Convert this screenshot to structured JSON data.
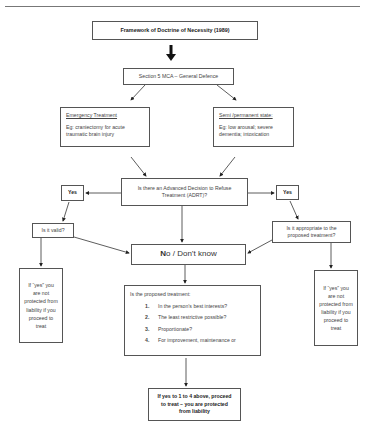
{
  "title_box": {
    "text": "Framework of Doctrine of Necessity (1989)"
  },
  "section5_box": {
    "text": "Section 5 MCA – General Defence"
  },
  "emergency_box": {
    "heading": "Emergency Treatment",
    "example": "Eg: craniectomy for acute traumatic brain injury"
  },
  "semi_permanent_box": {
    "heading": "Semi /permanent state:",
    "example": "Eg: low arousal; severe dementia; intoxication"
  },
  "adrt_box": {
    "text": "Is there an Advanced Decision to Refuse Treatment (ADRT)?"
  },
  "yes_left": {
    "text": "Yes"
  },
  "yes_right": {
    "text": "Yes"
  },
  "valid_box": {
    "text": "Is it valid?"
  },
  "appropriate_box": {
    "text": "Is it appropriate to the proposed treatment?"
  },
  "no_box": {
    "first_letter": "N",
    "rest": "o / Don’t know"
  },
  "liability_left": {
    "text": "If “yes” you are not protected from liability if you proceed to treat"
  },
  "liability_right": {
    "text": "If “yes” you are not protected from liability if you proceed to treat"
  },
  "proposed_box": {
    "heading": "Is the proposed treatment:",
    "items": [
      {
        "num": "1.",
        "text": "In the person’s best interests?"
      },
      {
        "num": "2.",
        "text": "The least restrictive possible?"
      },
      {
        "num": "3.",
        "text": "Proportionate?"
      },
      {
        "num": "4.",
        "text": "For improvement, maintenance or"
      }
    ]
  },
  "final_box": {
    "text": "If yes to 1 to 4 above, proceed to treat – you are protected from liability"
  }
}
